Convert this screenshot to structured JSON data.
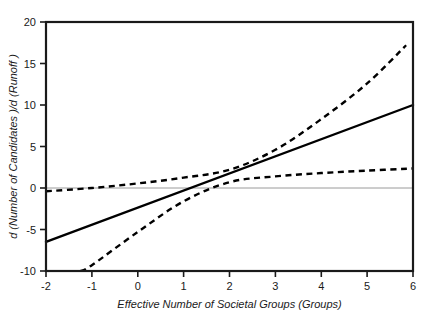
{
  "chart_data": {
    "type": "line",
    "title": "",
    "subtitle": "",
    "xlabel": "Effective Number of Societal Groups (Groups)",
    "ylabel": "d (Number of Candidates )/d (Runoff )",
    "xlim": [
      -2,
      6
    ],
    "ylim": [
      -10,
      20
    ],
    "xticks": [
      -2,
      -1,
      0,
      1,
      2,
      3,
      4,
      5,
      6
    ],
    "xtick_labels": [
      "-2",
      "-1",
      "0",
      "1",
      "2",
      "3",
      "4",
      "5",
      "6"
    ],
    "yticks": [
      -10,
      -5,
      0,
      5,
      10,
      15,
      20
    ],
    "ytick_labels": [
      "-10",
      "-5",
      "0",
      "5",
      "10",
      "15",
      "20"
    ],
    "grid": false,
    "legend": "none",
    "zero_reference_line": {
      "value": 0,
      "color": "#9a9a9a",
      "style": "solid",
      "width": 1
    },
    "series": [
      {
        "name": "Marginal effect",
        "style": "solid",
        "color": "#000000",
        "width": 2.4,
        "x": [
          -2,
          6
        ],
        "values": [
          -6.5,
          10.0
        ]
      },
      {
        "name": "Upper 95% confidence bound",
        "style": "dashed",
        "color": "#000000",
        "width": 2.4,
        "x": [
          -2,
          -1,
          0,
          1,
          2,
          3,
          4,
          5,
          5.85
        ],
        "values": [
          -0.4,
          0.0,
          0.55,
          1.25,
          2.2,
          4.6,
          8.3,
          12.6,
          17.2
        ]
      },
      {
        "name": "Lower 95% confidence bound",
        "style": "dashed",
        "color": "#000000",
        "width": 2.4,
        "x": [
          -1.25,
          -1,
          0,
          1,
          2,
          3,
          4,
          5,
          6
        ],
        "values": [
          -10.0,
          -9.3,
          -5.3,
          -1.6,
          0.7,
          1.4,
          1.8,
          2.1,
          2.35
        ]
      }
    ],
    "annotations": []
  },
  "axes": {
    "frame_color": "#1a1a1a",
    "tick_color": "#1a1a1a"
  }
}
